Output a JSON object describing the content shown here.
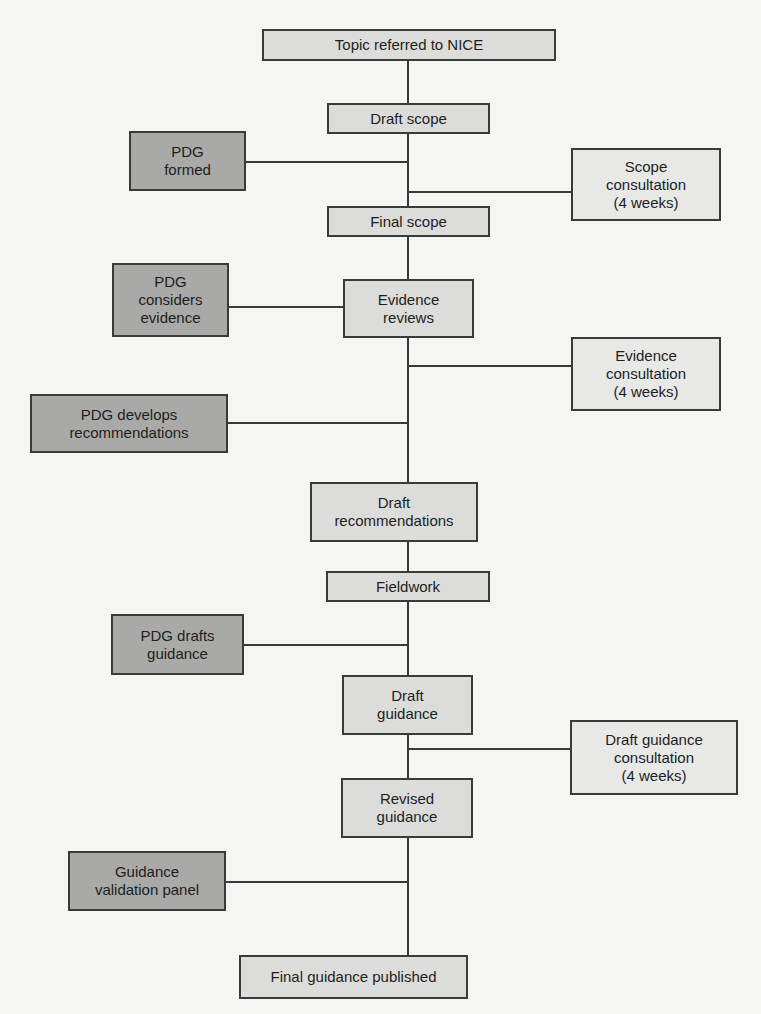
{
  "diagram": {
    "colors": {
      "main_step_fill": "#dcdcda",
      "pdg_step_fill": "#a9a9a7",
      "consultation_fill": "#e8e8e6",
      "line": "#3a3a3a",
      "background": "#f5f5f3"
    },
    "main_steps": [
      {
        "id": "topic-referred",
        "label": "Topic referred to NICE"
      },
      {
        "id": "draft-scope",
        "label": "Draft scope"
      },
      {
        "id": "final-scope",
        "label": "Final scope"
      },
      {
        "id": "evidence-reviews",
        "label": "Evidence\nreviews"
      },
      {
        "id": "draft-recommendations",
        "label": "Draft\nrecommendations"
      },
      {
        "id": "fieldwork",
        "label": "Fieldwork"
      },
      {
        "id": "draft-guidance",
        "label": "Draft\nguidance"
      },
      {
        "id": "revised-guidance",
        "label": "Revised\nguidance"
      },
      {
        "id": "final-guidance-published",
        "label": "Final guidance published"
      }
    ],
    "pdg_steps": [
      {
        "id": "pdg-formed",
        "label": "PDG\nformed"
      },
      {
        "id": "pdg-considers-evidence",
        "label": "PDG\nconsiders\nevidence"
      },
      {
        "id": "pdg-develops-recommendations",
        "label": "PDG develops\nrecommendations"
      },
      {
        "id": "pdg-drafts-guidance",
        "label": "PDG drafts\nguidance"
      },
      {
        "id": "guidance-validation-panel",
        "label": "Guidance\nvalidation panel"
      }
    ],
    "consultations": [
      {
        "id": "scope-consultation",
        "label": "Scope\nconsultation\n(4 weeks)"
      },
      {
        "id": "evidence-consultation",
        "label": "Evidence\nconsultation\n(4 weeks)"
      },
      {
        "id": "draft-guidance-consultation",
        "label": "Draft guidance\nconsultation\n(4 weeks)"
      }
    ]
  }
}
